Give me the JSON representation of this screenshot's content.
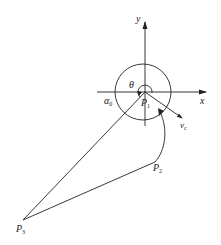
{
  "diagram": {
    "type": "geometry",
    "axes": {
      "x_label": "x",
      "y_label": "y"
    },
    "points": {
      "P1": {
        "label": "P",
        "sub": "1"
      },
      "P2": {
        "label": "P",
        "sub": "2"
      },
      "P3": {
        "label": "P",
        "sub": "3"
      }
    },
    "angles": {
      "theta": "θ",
      "alpha0": {
        "label": "α",
        "sub": "0"
      }
    },
    "vector": {
      "label": "v",
      "sub": "c"
    },
    "colors": {
      "stroke": "#222222",
      "background": "#ffffff"
    }
  }
}
